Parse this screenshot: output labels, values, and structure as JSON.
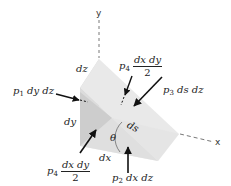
{
  "diagram": {
    "type": "free-body wedge element with pressure forces",
    "axes": {
      "y_label": "y",
      "x_label": "x"
    },
    "dimensions": {
      "dz": "dz",
      "dy": "dy",
      "dx": "dx",
      "ds": "ds",
      "angle": "θ"
    },
    "forces": {
      "p1": {
        "symbol": "p",
        "sub": "1",
        "expr": "dy dz"
      },
      "p2": {
        "symbol": "p",
        "sub": "2",
        "expr": "dx dz"
      },
      "p3": {
        "symbol": "p",
        "sub": "3",
        "expr": "ds dz"
      },
      "p4_top": {
        "symbol": "p",
        "sub": "4",
        "numerator": "dx dy",
        "denominator": "2"
      },
      "p4_bottom": {
        "symbol": "p",
        "sub": "4",
        "numerator": "dx dy",
        "denominator": "2"
      }
    },
    "colors": {
      "face_light": "#ececec",
      "face_mid": "#dedede",
      "face_dark": "#cfcfcf",
      "arrow": "#111111",
      "axis": "#555555"
    }
  }
}
